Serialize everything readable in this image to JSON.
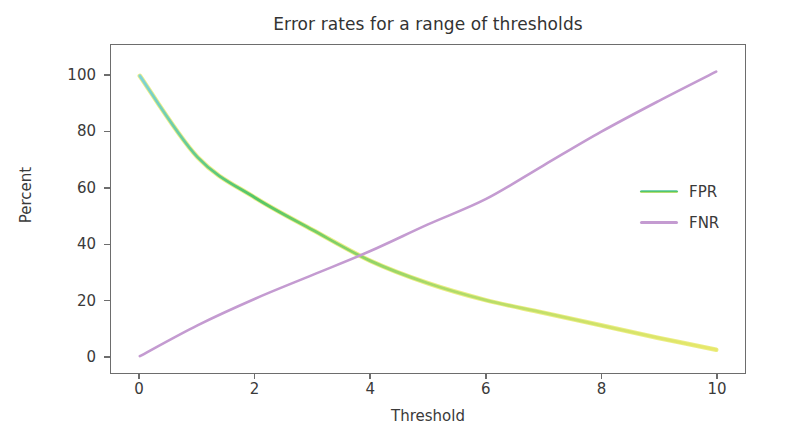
{
  "figure": {
    "background": "#ffffff",
    "axes_border_color": "#6d6d6d",
    "tick_text_color": "#3a3a3a"
  },
  "chart_data": {
    "type": "line",
    "title": "Error rates for a range of thresholds",
    "xlabel": "Threshold",
    "ylabel": "Percent",
    "xlim": [
      -0.5,
      10.5
    ],
    "ylim": [
      -6,
      111
    ],
    "xticks": [
      0,
      2,
      4,
      6,
      8,
      10
    ],
    "yticks": [
      0,
      20,
      40,
      60,
      80,
      100
    ],
    "xtick_labels": [
      "0",
      "2",
      "4",
      "6",
      "8",
      "10"
    ],
    "ytick_labels": [
      "0",
      "20",
      "40",
      "60",
      "80",
      "100"
    ],
    "grid": false,
    "legend_position": "center right",
    "x": [
      0,
      1,
      2,
      3,
      4,
      5,
      6,
      7,
      8,
      9,
      10
    ],
    "series": [
      {
        "name": "FPR",
        "color": "#55c667",
        "accent_color": "#e8e86a",
        "values": [
          100,
          71,
          56.5,
          45,
          34,
          26,
          20,
          15.5,
          11,
          6.5,
          2.3
        ]
      },
      {
        "name": "FNR",
        "color": "#c49bd1",
        "values": [
          0,
          11,
          20.5,
          29,
          37.5,
          47,
          56,
          68,
          80,
          91,
          101.5
        ]
      }
    ],
    "annotations": [
      {
        "text": "crossover",
        "x": 3.8,
        "y": 35
      }
    ]
  },
  "legend": {
    "items": [
      {
        "label": "FPR",
        "color": "#55c667"
      },
      {
        "label": "FNR",
        "color": "#c49bd1"
      }
    ]
  }
}
